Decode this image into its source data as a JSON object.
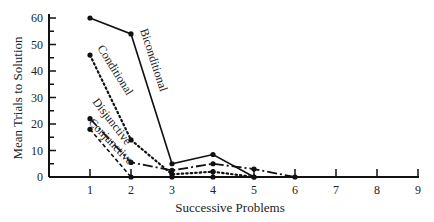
{
  "chart_data": {
    "type": "line",
    "title": "",
    "xlabel": "Successive Problems",
    "ylabel": "Mean Trials to Solution",
    "x_ticks": [
      1,
      2,
      3,
      4,
      5,
      6,
      7,
      8,
      9
    ],
    "y_ticks": [
      0,
      10,
      20,
      30,
      40,
      50,
      60
    ],
    "xlim": [
      0.3,
      9
    ],
    "ylim": [
      0,
      60
    ],
    "grid": false,
    "legend_position": "inline labels along lines",
    "series": [
      {
        "name": "Biconditional",
        "style": "solid",
        "x": [
          1,
          2,
          3,
          4,
          5
        ],
        "values": [
          60,
          54,
          5,
          8.5,
          0
        ]
      },
      {
        "name": "Conditional",
        "style": "dotted",
        "x": [
          1,
          2,
          3,
          4,
          5
        ],
        "values": [
          46,
          14,
          1,
          2,
          0
        ]
      },
      {
        "name": "Disjunctive",
        "style": "dashdot",
        "x": [
          1,
          2,
          3,
          4,
          5,
          6
        ],
        "values": [
          22,
          5.5,
          2.5,
          5,
          3,
          0
        ]
      },
      {
        "name": "Conjunctive",
        "style": "dashed",
        "x": [
          1,
          2,
          3,
          4
        ],
        "values": [
          18,
          0,
          0,
          0
        ]
      }
    ]
  }
}
